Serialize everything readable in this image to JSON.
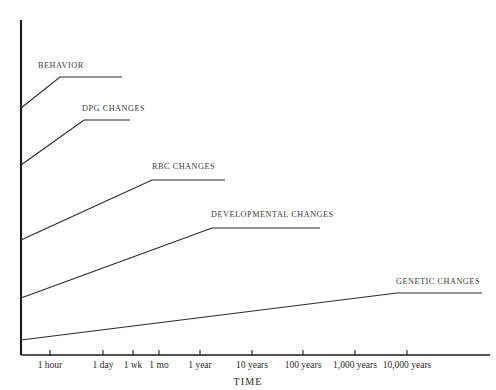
{
  "chart_data": {
    "type": "line",
    "title": "",
    "xlabel": "TIME",
    "ylabel": "e",
    "grid": false,
    "legend_position": "inline-labels",
    "x_tick_labels": [
      "1 hour",
      "1 day",
      "1 wk",
      "1 mo",
      "1 year",
      "10 years",
      "100 years",
      "1,000 years",
      "10,000 years"
    ],
    "x_tick_positions_px": [
      50,
      103,
      133,
      159,
      200,
      252,
      303,
      355,
      407
    ],
    "axis_color": "#1a1a1a",
    "line_color": "#2a2a28",
    "background_color": "#ffffff",
    "note": "Ramp-then-plateau curves showing the time course of adaptive responses; each series rises from the y-axis then levels off at a plateau.",
    "series": [
      {
        "name": "BEHAVIOR",
        "label": "BEHAVIOR",
        "start_time": "immediate",
        "plateau_time": "1 hour",
        "points_px": [
          [
            21,
            108
          ],
          [
            60,
            77
          ],
          [
            122,
            77
          ]
        ],
        "label_px": [
          38,
          62
        ]
      },
      {
        "name": "DPG CHANGES",
        "label": "DPG CHANGES",
        "start_time": "immediate",
        "plateau_time": "1 day",
        "points_px": [
          [
            21,
            165
          ],
          [
            84,
            120
          ],
          [
            130,
            120
          ]
        ],
        "label_px": [
          82,
          105
        ]
      },
      {
        "name": "RBC CHANGES",
        "label": "RBC CHANGES",
        "start_time": "immediate",
        "plateau_time": "1 wk",
        "points_px": [
          [
            21,
            240
          ],
          [
            152,
            180
          ],
          [
            225,
            180
          ]
        ],
        "label_px": [
          152,
          163
        ]
      },
      {
        "name": "DEVELOPMENTAL CHANGES",
        "label": "DEVELOPMENTAL CHANGES",
        "start_time": "immediate",
        "plateau_time": "1 year",
        "points_px": [
          [
            21,
            298
          ],
          [
            212,
            228
          ],
          [
            320,
            228
          ]
        ],
        "label_px": [
          211,
          211
        ]
      },
      {
        "name": "GENETIC CHANGES",
        "label": "GENETIC CHANGES",
        "start_time": "immediate",
        "plateau_time": "10,000 years",
        "points_px": [
          [
            21,
            340
          ],
          [
            397,
            293
          ],
          [
            482,
            293
          ]
        ],
        "label_px": [
          396,
          278
        ]
      }
    ],
    "axes": {
      "y_axis_px": [
        [
          21,
          20
        ],
        [
          21,
          355
        ]
      ],
      "x_axis_px": [
        [
          21,
          355
        ],
        [
          490,
          355
        ]
      ],
      "tick_length_px": 5
    }
  }
}
